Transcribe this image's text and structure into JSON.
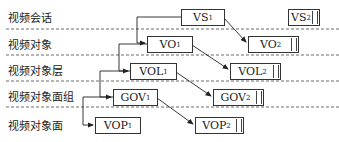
{
  "layers": [
    {
      "label": "视频会话"
    },
    {
      "label": "视频对象"
    },
    {
      "label": "视频对象层"
    },
    {
      "label": "视频对象面组"
    },
    {
      "label": "视频对象面"
    }
  ],
  "nodes": {
    "vs1": {
      "base": "VS",
      "sub": "1"
    },
    "vs2": {
      "base": "VS",
      "sub": "2"
    },
    "vo1": {
      "base": "VO",
      "sub": "1"
    },
    "vo2": {
      "base": "VO",
      "sub": "2"
    },
    "vol1": {
      "base": "VOL",
      "sub": "1"
    },
    "vol2": {
      "base": "VOL",
      "sub": "2"
    },
    "gov1": {
      "base": "GOV",
      "sub": "1"
    },
    "gov2": {
      "base": "GOV",
      "sub": "2"
    },
    "vop1": {
      "base": "VOP",
      "sub": "1"
    },
    "vop2": {
      "base": "VOP",
      "sub": "2"
    }
  }
}
